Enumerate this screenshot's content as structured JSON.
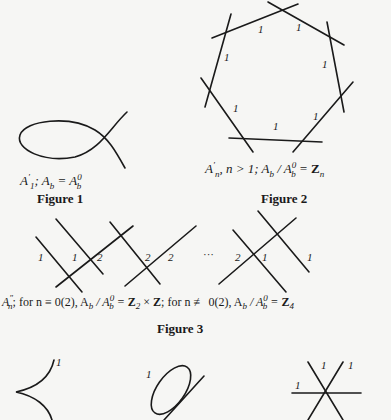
{
  "figures": [
    {
      "title": "Figure 1",
      "caption": {
        "symbol": "A",
        "prime": "′",
        "sub": "1",
        "text": "; A",
        "b_sub": "b",
        "eq": " = A",
        "eq_sup": "0",
        "eq_sub": "b"
      }
    },
    {
      "title": "Figure 2",
      "caption": {
        "symbol": "A",
        "prime": "′",
        "sub": "n",
        "cond": ",  n > 1;  A",
        "b_sub": "b",
        "slash": " / A",
        "sup0": "0",
        "sub_b": "b",
        "eq": " = ",
        "Z": "Z",
        "Z_sub": "n"
      },
      "edge_labels": [
        "1",
        "1",
        "1",
        "1",
        "1",
        "1",
        "1"
      ]
    },
    {
      "title": "Figure 3",
      "caption": {
        "symbol": "A",
        "dprime": "″",
        "sub": "n",
        "part1": "; for  n ≡ 0(2), A",
        "b1": "b",
        "s1": " / A",
        "sup1": "0",
        "sub1": "b",
        "eq1": " = ",
        "Z2": "Z",
        "Z2_sub": "2",
        "times": " × ",
        "Z": "Z",
        "part2": "; for  n ≢ 0(2),  A",
        "b2": "b",
        "s2": " / A",
        "sup2": "0",
        "sub2": "b",
        "eq2": " = ",
        "Z4": "Z",
        "Z4_sub": "4"
      },
      "labels": [
        "1",
        "1",
        "2",
        "2",
        "2",
        "2",
        "1",
        "1"
      ],
      "ellipsis": "···"
    }
  ],
  "bottom_row_labels": [
    "1",
    "1",
    "1",
    "1",
    "1"
  ]
}
